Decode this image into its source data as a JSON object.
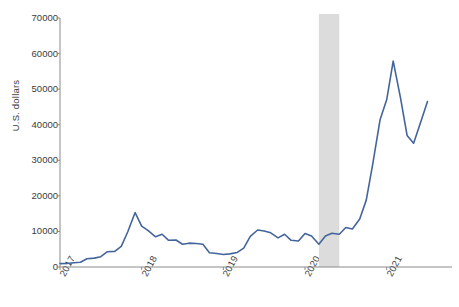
{
  "chart_data": {
    "type": "line",
    "title": "",
    "subtitle": "",
    "xlabel": "",
    "ylabel": "U.S. dollars",
    "ylim": [
      0,
      70000
    ],
    "xlim": [
      "2017",
      "2021.8"
    ],
    "grid": false,
    "legend_position": "none",
    "line_color": "#44659c",
    "series": [
      {
        "name": "U.S. dollars",
        "x": [
          2017.0,
          2017.08,
          2017.17,
          2017.25,
          2017.33,
          2017.42,
          2017.5,
          2017.58,
          2017.67,
          2017.75,
          2017.83,
          2017.92,
          2018.0,
          2018.08,
          2018.17,
          2018.25,
          2018.33,
          2018.42,
          2018.5,
          2018.58,
          2018.67,
          2018.75,
          2018.83,
          2018.92,
          2019.0,
          2019.08,
          2019.17,
          2019.25,
          2019.33,
          2019.42,
          2019.5,
          2019.58,
          2019.67,
          2019.75,
          2019.83,
          2019.92,
          2020.0,
          2020.08,
          2020.17,
          2020.25,
          2020.33,
          2020.42,
          2020.5,
          2020.58,
          2020.67,
          2020.75,
          2020.83,
          2020.92,
          2021.0,
          2021.08,
          2021.17,
          2021.25,
          2021.33,
          2021.42,
          2021.5
        ],
        "values": [
          960,
          1000,
          1180,
          1350,
          2300,
          2500,
          2900,
          4300,
          4400,
          5800,
          9900,
          15300,
          11500,
          10200,
          8500,
          9200,
          7500,
          7600,
          6400,
          6700,
          6600,
          6400,
          4000,
          3800,
          3500,
          3700,
          4100,
          5300,
          8600,
          10400,
          10100,
          9600,
          8200,
          9200,
          7500,
          7300,
          9400,
          8700,
          6400,
          8700,
          9500,
          9200,
          11100,
          10700,
          13500,
          18800,
          29000,
          41500,
          47000,
          57900,
          47500,
          37000,
          34800,
          41000,
          46500
        ]
      }
    ],
    "yticks": [
      0,
      10000,
      20000,
      30000,
      40000,
      50000,
      60000,
      70000
    ],
    "ytick_labels": [
      "0",
      "10000",
      "20000",
      "30000",
      "40000",
      "50000",
      "60000",
      "70000"
    ],
    "xticks": [
      2017,
      2018,
      2019,
      2020,
      2021
    ],
    "xtick_labels": [
      "2017",
      "2018",
      "2019",
      "2020",
      "2021"
    ],
    "shaded_regions": [
      {
        "name": "recession-band",
        "x_start": 2020.17,
        "x_end": 2020.42,
        "color": "#dcdcdc"
      }
    ]
  }
}
